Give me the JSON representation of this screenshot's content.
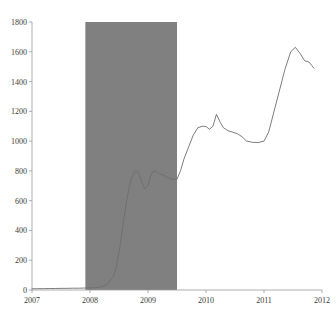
{
  "chart_data": {
    "type": "line",
    "title": "",
    "subtitle": "",
    "xlabel": "",
    "ylabel": "",
    "xlim": [
      2007.0,
      2012.0
    ],
    "ylim": [
      0,
      1800
    ],
    "grid": false,
    "legend": "none",
    "y_ticks": [
      0,
      200,
      400,
      600,
      800,
      1000,
      1200,
      1400,
      1600,
      1800
    ],
    "y_tick_labels": [
      "0",
      "200",
      "400",
      "600",
      "800",
      "1000",
      "1200",
      "1400",
      "1600",
      "1800"
    ],
    "x_ticks": [
      2007,
      2008,
      2009,
      2010,
      2011,
      2012
    ],
    "x_tick_labels": [
      "2007",
      "2008",
      "2009",
      "2010",
      "2011",
      "2012"
    ],
    "series": [
      {
        "name": "series-1",
        "color": "#6e6e6e",
        "x": [
          2007.0,
          2007.1,
          2007.2,
          2007.3,
          2007.4,
          2007.5,
          2007.6,
          2007.7,
          2007.8,
          2007.9,
          2008.0,
          2008.1,
          2008.2,
          2008.3,
          2008.4,
          2008.45,
          2008.52,
          2008.58,
          2008.64,
          2008.7,
          2008.76,
          2008.82,
          2008.88,
          2008.94,
          2009.0,
          2009.04,
          2009.08,
          2009.12,
          2009.16,
          2009.2,
          2009.26,
          2009.32,
          2009.38,
          2009.44,
          2009.5,
          2009.56,
          2009.62,
          2009.7,
          2009.78,
          2009.86,
          2009.94,
          2010.0,
          2010.06,
          2010.12,
          2010.18,
          2010.24,
          2010.3,
          2010.38,
          2010.46,
          2010.54,
          2010.62,
          2010.7,
          2010.8,
          2010.9,
          2011.0,
          2011.08,
          2011.16,
          2011.26,
          2011.36,
          2011.46,
          2011.54,
          2011.62,
          2011.7,
          2011.78,
          2011.86
        ],
        "y": [
          8,
          9,
          9,
          10,
          10,
          11,
          11,
          12,
          12,
          13,
          14,
          16,
          22,
          40,
          90,
          150,
          300,
          470,
          620,
          730,
          790,
          800,
          740,
          680,
          700,
          760,
          795,
          800,
          790,
          780,
          772,
          760,
          748,
          742,
          745,
          800,
          880,
          960,
          1040,
          1090,
          1100,
          1098,
          1080,
          1100,
          1180,
          1130,
          1090,
          1070,
          1060,
          1050,
          1030,
          1000,
          992,
          990,
          1000,
          1060,
          1180,
          1330,
          1480,
          1600,
          1630,
          1590,
          1540,
          1530,
          1490
        ]
      }
    ],
    "shaded_bands": [
      {
        "name": "recession-band",
        "x_start": 2007.92,
        "x_end": 2009.5,
        "y_start": 0,
        "y_end": 1800,
        "color": "#808080"
      }
    ]
  }
}
